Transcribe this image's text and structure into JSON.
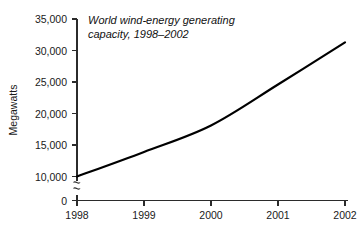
{
  "chart_data": {
    "type": "line",
    "title": "World wind-energy generating capacity, 1998–2002",
    "title_line1": "World wind-energy generating",
    "title_line2": "capacity, 1998–2002",
    "xlabel": "",
    "ylabel": "Megawatts",
    "categories": [
      "1998",
      "1999",
      "2000",
      "2001",
      "2002"
    ],
    "x": [
      1998,
      1999,
      2000,
      2001,
      2002
    ],
    "values": [
      10000,
      13900,
      18100,
      24600,
      31300
    ],
    "series": [
      {
        "name": "World wind-energy generating capacity",
        "values": [
          10000,
          13900,
          18100,
          24600,
          31300
        ],
        "color": "#000000"
      }
    ],
    "ylim": [
      0,
      35000
    ],
    "y_ticks": [
      0,
      10000,
      15000,
      20000,
      25000,
      30000,
      35000
    ],
    "y_tick_labels": [
      "0",
      "10,000",
      "15,000",
      "20,000",
      "25,000",
      "30,000",
      "35,000"
    ],
    "x_tick_labels": [
      "1998",
      "1999",
      "2000",
      "2001",
      "2002"
    ],
    "axis_break": true,
    "axis_break_between": [
      0,
      10000
    ],
    "grid": false,
    "legend": false,
    "legend_position": "none",
    "line_color": "#000000",
    "axis_color": "#2b2b2b",
    "background": "#ffffff"
  }
}
